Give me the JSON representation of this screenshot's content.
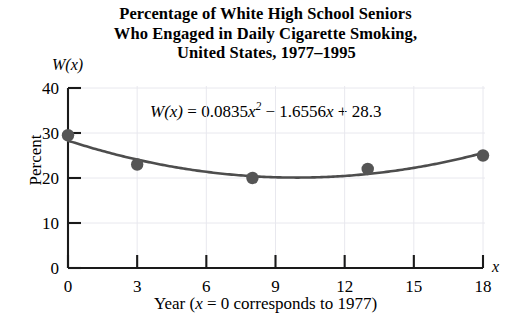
{
  "title": {
    "line1": "Percentage of White High School Seniors",
    "line2": "Who Engaged in Daily Cigarette Smoking,",
    "line3": "United States, 1977–1995"
  },
  "equation": {
    "lhs": "W(x)",
    "eq": "=",
    "coef_a": "0.0835",
    "term_a": "x",
    "exponent": "2",
    "minus": "−",
    "coef_b": "1.6556",
    "term_b": "x",
    "plus": "+",
    "constant": "28.3",
    "full": "W(x) = 0.0835x² − 1.6556x + 28.3"
  },
  "axes": {
    "y_axis_name": "W(x)",
    "x_axis_name": "x",
    "y_axis_label": "Percent",
    "x_axis_caption_prefix": "Year (",
    "x_axis_caption_var": "x",
    "x_axis_caption_suffix": " = 0 corresponds to 1977)",
    "x_axis_caption_full": "Year (x = 0 corresponds to 1977)",
    "origin_label": "0"
  },
  "colors": {
    "curve": "#4d4d4d",
    "marker": "#555555",
    "axis": "#1a1a1a",
    "grid": "#e8e8ee",
    "background": "#ffffff",
    "text": "#000000"
  },
  "chart_data": {
    "type": "scatter",
    "title": "Percentage of White High School Seniors Who Engaged in Daily Cigarette Smoking, United States, 1977–1995",
    "xlabel": "Year (x = 0 corresponds to 1977)",
    "ylabel": "Percent",
    "xlim": [
      0,
      18
    ],
    "ylim": [
      0,
      40
    ],
    "xticks": [
      0,
      3,
      6,
      9,
      12,
      15,
      18
    ],
    "yticks": [
      0,
      10,
      20,
      30,
      40
    ],
    "xtick_labels": [
      "0",
      "3",
      "6",
      "9",
      "12",
      "15",
      "18"
    ],
    "ytick_labels": [
      "0",
      "10",
      "20",
      "30",
      "40"
    ],
    "grid": true,
    "legend": null,
    "series": [
      {
        "name": "Observed data",
        "type": "scatter",
        "marker": "filled-circle",
        "points": [
          {
            "x": 0,
            "y": 29.5
          },
          {
            "x": 3,
            "y": 23.0
          },
          {
            "x": 8,
            "y": 20.0
          },
          {
            "x": 13,
            "y": 22.0
          },
          {
            "x": 18,
            "y": 25.0
          }
        ]
      },
      {
        "name": "Quadratic model W(x) = 0.0835x² − 1.6556x + 28.3",
        "type": "line",
        "model": {
          "a": 0.0835,
          "b": -1.6556,
          "c": 28.3
        },
        "x_range": [
          0,
          18
        ]
      }
    ],
    "annotations": [
      {
        "text": "W(x) = 0.0835x² − 1.6556x + 28.3",
        "x": 9,
        "y": 36
      }
    ]
  }
}
